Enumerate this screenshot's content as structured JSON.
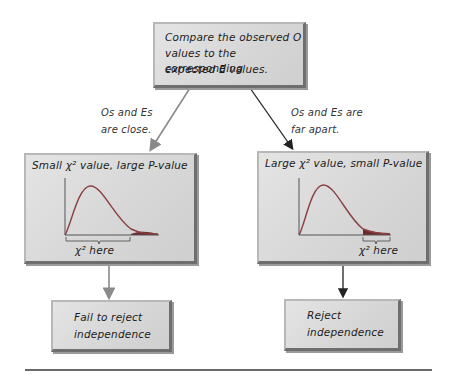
{
  "top_box": {
    "line1": "Compare the observed O",
    "line2": "values to the corresponding",
    "line3": "expected E values."
  },
  "left_branch": {
    "condition_line1": "Os and Es",
    "condition_line2": "are close.",
    "box_title": "Small χ² value, large P-value",
    "chart_label": "χ² here",
    "result_line1": "Fail to reject",
    "result_line2": "independence",
    "arrow_color": "#8a8a8a"
  },
  "right_branch": {
    "condition_line1": "Os and Es are",
    "condition_line2": "far apart.",
    "box_title": "Large χ² value, small P-value",
    "chart_label": "χ² here",
    "result_line1": "Reject",
    "result_line2": "independence",
    "arrow_color": "#222222"
  },
  "colors": {
    "box_fill": "#d8d8d8",
    "curve": "#8a3f3f",
    "tail_fill": "#6b2a2a",
    "axis": "#555555"
  }
}
